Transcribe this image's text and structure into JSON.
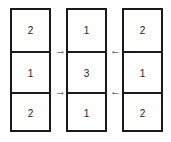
{
  "grid": {
    "columns": [
      {
        "cells": [
          "2",
          "1",
          "2"
        ]
      },
      {
        "cells": [
          "1",
          "3",
          "1"
        ]
      },
      {
        "cells": [
          "2",
          "1",
          "2"
        ]
      }
    ]
  },
  "arrows": {
    "right_top": "→",
    "right_bottom": "→",
    "left_top": "←",
    "left_bottom": "←"
  }
}
